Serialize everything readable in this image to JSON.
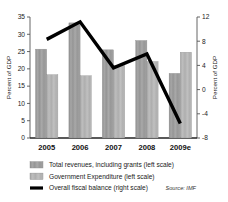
{
  "chart_data": {
    "type": "bar",
    "title": "",
    "subtitle": "",
    "xlabel": "",
    "ylabel": "Percent of GDP",
    "y2label": "Percent of GDP",
    "categories": [
      "2005",
      "2006",
      "2007",
      "2008",
      "2009e"
    ],
    "ylim": [
      0,
      35
    ],
    "y2lim": [
      -8,
      12
    ],
    "yticks": [
      "0",
      "5",
      "10",
      "15",
      "20",
      "25",
      "30",
      "35"
    ],
    "ytick_values": [
      0,
      5,
      10,
      15,
      20,
      25,
      30,
      35
    ],
    "y2ticks": [
      "-8",
      "-4",
      "0",
      "4",
      "8",
      "12"
    ],
    "y2tick_values": [
      -8,
      -4,
      0,
      4,
      8,
      12
    ],
    "grid": false,
    "legend_position": "below",
    "series": [
      {
        "name": "Total revenues, including grants (left scale)",
        "type": "bar",
        "axis": "left",
        "color": "#9a9a9a",
        "values": [
          25.7,
          33.3,
          25.5,
          28.2,
          18.7
        ]
      },
      {
        "name": "Government Expenditure (left scale)",
        "type": "bar",
        "axis": "left",
        "color": "#b3b3b3",
        "values": [
          18.3,
          18.0,
          21.0,
          22.1,
          24.8
        ]
      },
      {
        "name": "Overall fiscal balance (right scale)",
        "type": "line",
        "axis": "right",
        "color": "#000000",
        "values": [
          8.3,
          11.2,
          3.6,
          5.9,
          -5.6
        ]
      }
    ],
    "source": "Source: IMF"
  },
  "legend": {
    "items": [
      {
        "label": "Total revenues, including grants (left scale)",
        "swatch": "bar-dark"
      },
      {
        "label": "Government Expenditure (left scale)",
        "swatch": "bar-light"
      },
      {
        "label": "Overall fiscal balance (right scale)",
        "swatch": "line-black"
      }
    ]
  },
  "colors": {
    "bar_revenue": "#9a9a9a",
    "bar_expenditure": "#b3b3b3",
    "line": "#000000",
    "axis": "#555555",
    "text": "#1a1a1a",
    "background": "#ffffff"
  }
}
